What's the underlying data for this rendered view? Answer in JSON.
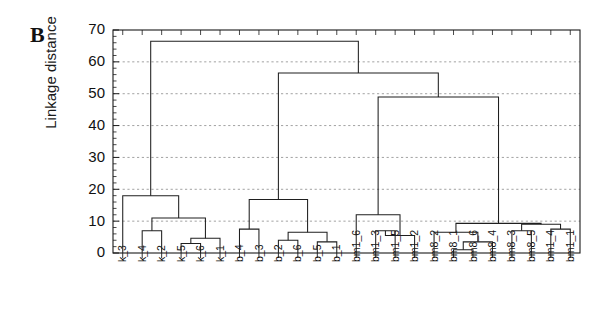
{
  "panel": {
    "letter": "B"
  },
  "axes": {
    "ylabel": "Linkage distance",
    "ytick_labels": [
      "0",
      "10",
      "20",
      "30",
      "40",
      "50",
      "60",
      "70"
    ],
    "ytick_values": [
      0,
      10,
      20,
      30,
      40,
      50,
      60,
      70
    ],
    "ylim": [
      0,
      70
    ],
    "grid": true,
    "grid_color": "#8a8a8a",
    "line_color": "#1f1f1f"
  },
  "chart_data": {
    "type": "line",
    "subtype": "dendrogram",
    "title": "",
    "xlabel": "",
    "ylabel": "Linkage distance",
    "ylim": [
      0,
      70
    ],
    "grid": true,
    "orientation": "vertical",
    "leaf_order": [
      "k_3",
      "k_4",
      "k_2",
      "k_5",
      "k_6",
      "k_1",
      "b_4",
      "b_3",
      "b_2",
      "b_6",
      "b_5",
      "b_1",
      "bm1_6",
      "bm1_3",
      "bm1_5",
      "bm1_2",
      "bm8_2",
      "bm8_1",
      "bm8_6",
      "bm8_4",
      "bm8_3",
      "bm8_5",
      "bm1_4",
      "bm1_1"
    ],
    "categories": [
      "k_3",
      "k_4",
      "k_2",
      "k_5",
      "k_6",
      "k_1",
      "b_4",
      "b_3",
      "b_2",
      "b_6",
      "b_5",
      "b_1",
      "bm1_6",
      "bm1_3",
      "bm1_5",
      "bm1_2",
      "bm8_2",
      "bm8_1",
      "bm8_6",
      "bm8_4",
      "bm8_3",
      "bm8_5",
      "bm1_4",
      "bm1_1"
    ],
    "merges": [
      {
        "id": "m1",
        "left": "k_4",
        "right": "k_2",
        "height": 7.0
      },
      {
        "id": "m2",
        "left": "k_5",
        "right": "k_6",
        "height": 3.0
      },
      {
        "id": "m3",
        "left": "m2",
        "right": "k_1",
        "height": 4.6
      },
      {
        "id": "m4",
        "left": "m1",
        "right": "m3",
        "height": 11.0
      },
      {
        "id": "m5",
        "left": "k_3",
        "right": "m4",
        "height": 18.0
      },
      {
        "id": "m6",
        "left": "b_4",
        "right": "b_3",
        "height": 7.5
      },
      {
        "id": "m7",
        "left": "b_2",
        "right": "b_6",
        "height": 4.0
      },
      {
        "id": "m8",
        "left": "b_5",
        "right": "b_1",
        "height": 3.5
      },
      {
        "id": "m9",
        "left": "m7",
        "right": "m8",
        "height": 6.5
      },
      {
        "id": "m10",
        "left": "m6",
        "right": "m9",
        "height": 16.8
      },
      {
        "id": "m11",
        "left": "bm1_3",
        "right": "bm1_5",
        "height": 7.0
      },
      {
        "id": "m12",
        "left": "m11",
        "right": "bm1_2",
        "height": 5.5
      },
      {
        "id": "m13",
        "left": "bm1_6",
        "right": "m12",
        "height": 12.0
      },
      {
        "id": "m14",
        "left": "bm8_1",
        "right": "bm8_6",
        "height": 1.0
      },
      {
        "id": "m15",
        "left": "m14",
        "right": "bm8_4",
        "height": 3.5
      },
      {
        "id": "m16",
        "left": "bm8_2",
        "right": "m15",
        "height": 6.5
      },
      {
        "id": "m17",
        "left": "bm8_3",
        "right": "bm8_5",
        "height": 7.0
      },
      {
        "id": "m18",
        "left": "bm1_4",
        "right": "bm1_1",
        "height": 7.5
      },
      {
        "id": "m19",
        "left": "m17",
        "right": "m18",
        "height": 9.0
      },
      {
        "id": "m20",
        "left": "m16",
        "right": "m19",
        "height": 9.3
      },
      {
        "id": "m21",
        "left": "m13",
        "right": "m20",
        "height": 49.0
      },
      {
        "id": "m22",
        "left": "m10",
        "right": "m21",
        "height": 56.5
      },
      {
        "id": "m23",
        "left": "m5",
        "right": "m22",
        "height": 66.5
      }
    ]
  }
}
